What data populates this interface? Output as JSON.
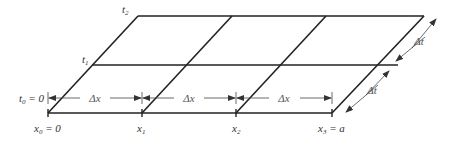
{
  "figure": {
    "type": "finite-difference grid (x–t plane, perspective)",
    "stroke_color": "#222222",
    "time_levels": [
      {
        "name": "t0",
        "label": "t",
        "sub": "0",
        "suffix": " = 0"
      },
      {
        "name": "t1",
        "label": "t",
        "sub": "1",
        "suffix": ""
      },
      {
        "name": "t2",
        "label": "t",
        "sub": "2",
        "suffix": ""
      }
    ],
    "space_nodes": [
      {
        "name": "x0",
        "label": "x",
        "sub": "0",
        "suffix": " = 0"
      },
      {
        "name": "x1",
        "label": "x",
        "sub": "1",
        "suffix": ""
      },
      {
        "name": "x2",
        "label": "x",
        "sub": "2",
        "suffix": ""
      },
      {
        "name": "x3",
        "label": "x",
        "sub": "3",
        "suffix": " = a"
      }
    ],
    "dimensions": {
      "dx": [
        "Δx",
        "Δx",
        "Δx"
      ],
      "dt": [
        "Δt",
        "Δt"
      ]
    }
  }
}
